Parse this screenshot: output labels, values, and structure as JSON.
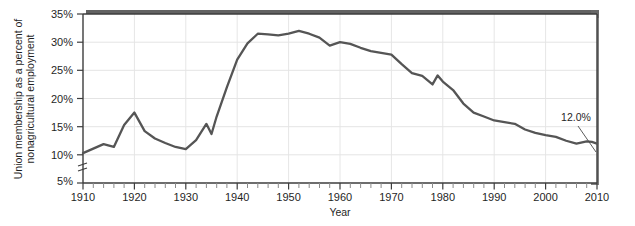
{
  "figure": {
    "name": "union-membership-line-chart",
    "background_color": "#ffffff",
    "frame_color": "#3d3d3d",
    "shadow_color": "#6e6e6e",
    "gridline_color": "#e2e2e2",
    "line_color": "#555555"
  },
  "chart_data": {
    "type": "line",
    "title": "",
    "xlabel": "Year",
    "ylabel": "Union membership as a percent of nonagricultural employment",
    "ylabel_line1": "Union membership as a percent of",
    "ylabel_line2": "nonagricultural employment",
    "xlim": [
      1910,
      2010
    ],
    "ylim": [
      5,
      35
    ],
    "y_axis_break": true,
    "y_axis_break_note": "axis break between 5% and 10%",
    "grid": "vertical gridlines at decades, horizontal gridlines at 10% ticks",
    "legend": "none",
    "xticks": [
      1910,
      1920,
      1930,
      1940,
      1950,
      1960,
      1970,
      1980,
      1990,
      2000,
      2010
    ],
    "xtick_labels": [
      "1910",
      "1920",
      "1930",
      "1940",
      "1950",
      "1960",
      "1970",
      "1980",
      "1990",
      "2000",
      "2010"
    ],
    "x_minor_tick_interval": 2,
    "yticks": [
      5,
      10,
      15,
      20,
      25,
      30,
      35
    ],
    "ytick_labels": [
      "5%",
      "10%",
      "15%",
      "20%",
      "25%",
      "30%",
      "35%"
    ],
    "annotations": [
      {
        "text": "12.0%",
        "points_to_year": 2010,
        "points_to_value": 12.0,
        "name": "endpoint-annotation"
      }
    ],
    "series": [
      {
        "name": "Union membership as a percent of nonagricultural employment",
        "x": [
          1910,
          1912,
          1914,
          1916,
          1918,
          1920,
          1922,
          1924,
          1926,
          1928,
          1930,
          1932,
          1934,
          1935,
          1936,
          1938,
          1940,
          1942,
          1944,
          1946,
          1948,
          1950,
          1952,
          1954,
          1956,
          1958,
          1960,
          1962,
          1964,
          1966,
          1968,
          1970,
          1972,
          1974,
          1976,
          1978,
          1979,
          1980,
          1982,
          1984,
          1986,
          1988,
          1990,
          1992,
          1994,
          1996,
          1998,
          2000,
          2002,
          2004,
          2006,
          2008,
          2009,
          2010
        ],
        "values": [
          10.3,
          11.1,
          11.9,
          11.4,
          15.3,
          17.5,
          14.2,
          12.9,
          12.1,
          11.4,
          11.0,
          12.6,
          15.5,
          13.7,
          16.8,
          22.0,
          26.9,
          29.8,
          31.5,
          31.4,
          31.2,
          31.5,
          32.0,
          31.5,
          30.8,
          29.4,
          30.0,
          29.7,
          29.0,
          28.4,
          28.1,
          27.8,
          26.1,
          24.5,
          24.0,
          22.5,
          24.1,
          23.0,
          21.5,
          19.1,
          17.5,
          16.8,
          16.1,
          15.8,
          15.5,
          14.5,
          13.9,
          13.5,
          13.2,
          12.5,
          12.0,
          12.4,
          12.3,
          12.0
        ]
      }
    ]
  },
  "axis": {
    "x_title": "Year",
    "y_title_line1": "Union membership as a percent of",
    "y_title_line2": "nonagricultural employment"
  }
}
